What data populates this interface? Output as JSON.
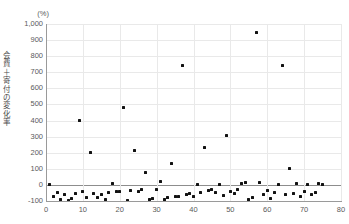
{
  "chart_data": {
    "type": "scatter",
    "title": "",
    "unit_label": "(%)",
    "ylabel": "会費＋寄付の変化率",
    "xlabel": "",
    "xlim": [
      0,
      80
    ],
    "ylim": [
      -100,
      1000
    ],
    "yticks": [
      -100,
      0,
      100,
      200,
      300,
      400,
      500,
      600,
      700,
      800,
      900,
      1000
    ],
    "ytick_labels": [
      "-100",
      "0",
      "100",
      "200",
      "300",
      "400",
      "500",
      "600",
      "700",
      "800",
      "900",
      "1,000"
    ],
    "xticks": [
      0,
      10,
      20,
      30,
      40,
      50,
      60,
      70,
      80
    ],
    "xtick_labels": [
      "0",
      "10",
      "20",
      "30",
      "40",
      "50",
      "60",
      "70",
      "80"
    ],
    "grid": true,
    "legend": "none",
    "marker_color": "#121212",
    "grid_color": "#e9e9e9",
    "axis_color": "#9a9a9a",
    "points": [
      [
        1,
        0
      ],
      [
        2,
        -72
      ],
      [
        3,
        -45
      ],
      [
        4,
        -88
      ],
      [
        5,
        -60
      ],
      [
        6,
        -95
      ],
      [
        7,
        -85
      ],
      [
        8,
        -52
      ],
      [
        9,
        400
      ],
      [
        10,
        -40
      ],
      [
        11,
        -78
      ],
      [
        12,
        200
      ],
      [
        13,
        -55
      ],
      [
        14,
        -80
      ],
      [
        15,
        -62
      ],
      [
        16,
        -92
      ],
      [
        17,
        -48
      ],
      [
        18,
        10
      ],
      [
        19,
        -38
      ],
      [
        20,
        -40
      ],
      [
        21,
        480
      ],
      [
        22,
        -95
      ],
      [
        23,
        -35
      ],
      [
        24,
        215
      ],
      [
        25,
        -42
      ],
      [
        26,
        -30
      ],
      [
        27,
        75
      ],
      [
        28,
        -88
      ],
      [
        29,
        -82
      ],
      [
        30,
        -30
      ],
      [
        31,
        20
      ],
      [
        32,
        -90
      ],
      [
        33,
        -80
      ],
      [
        34,
        130
      ],
      [
        35,
        -72
      ],
      [
        36,
        -70
      ],
      [
        37,
        745
      ],
      [
        38,
        -62
      ],
      [
        39,
        -55
      ],
      [
        40,
        -75
      ],
      [
        41,
        5
      ],
      [
        42,
        -45
      ],
      [
        43,
        235
      ],
      [
        44,
        -35
      ],
      [
        45,
        -30
      ],
      [
        46,
        -48
      ],
      [
        47,
        3
      ],
      [
        48,
        -65
      ],
      [
        49,
        305
      ],
      [
        50,
        -40
      ],
      [
        51,
        -52
      ],
      [
        52,
        -28
      ],
      [
        53,
        8
      ],
      [
        54,
        12
      ],
      [
        55,
        -88
      ],
      [
        56,
        -80
      ],
      [
        57,
        950
      ],
      [
        58,
        15
      ],
      [
        59,
        -58
      ],
      [
        60,
        -35
      ],
      [
        61,
        -82
      ],
      [
        62,
        -45
      ],
      [
        63,
        5
      ],
      [
        64,
        745
      ],
      [
        65,
        -60
      ],
      [
        66,
        105
      ],
      [
        67,
        -55
      ],
      [
        68,
        8
      ],
      [
        69,
        -70
      ],
      [
        70,
        -40
      ],
      [
        71,
        5
      ],
      [
        72,
        -62
      ],
      [
        73,
        -45
      ],
      [
        74,
        10
      ],
      [
        75,
        0
      ]
    ]
  }
}
